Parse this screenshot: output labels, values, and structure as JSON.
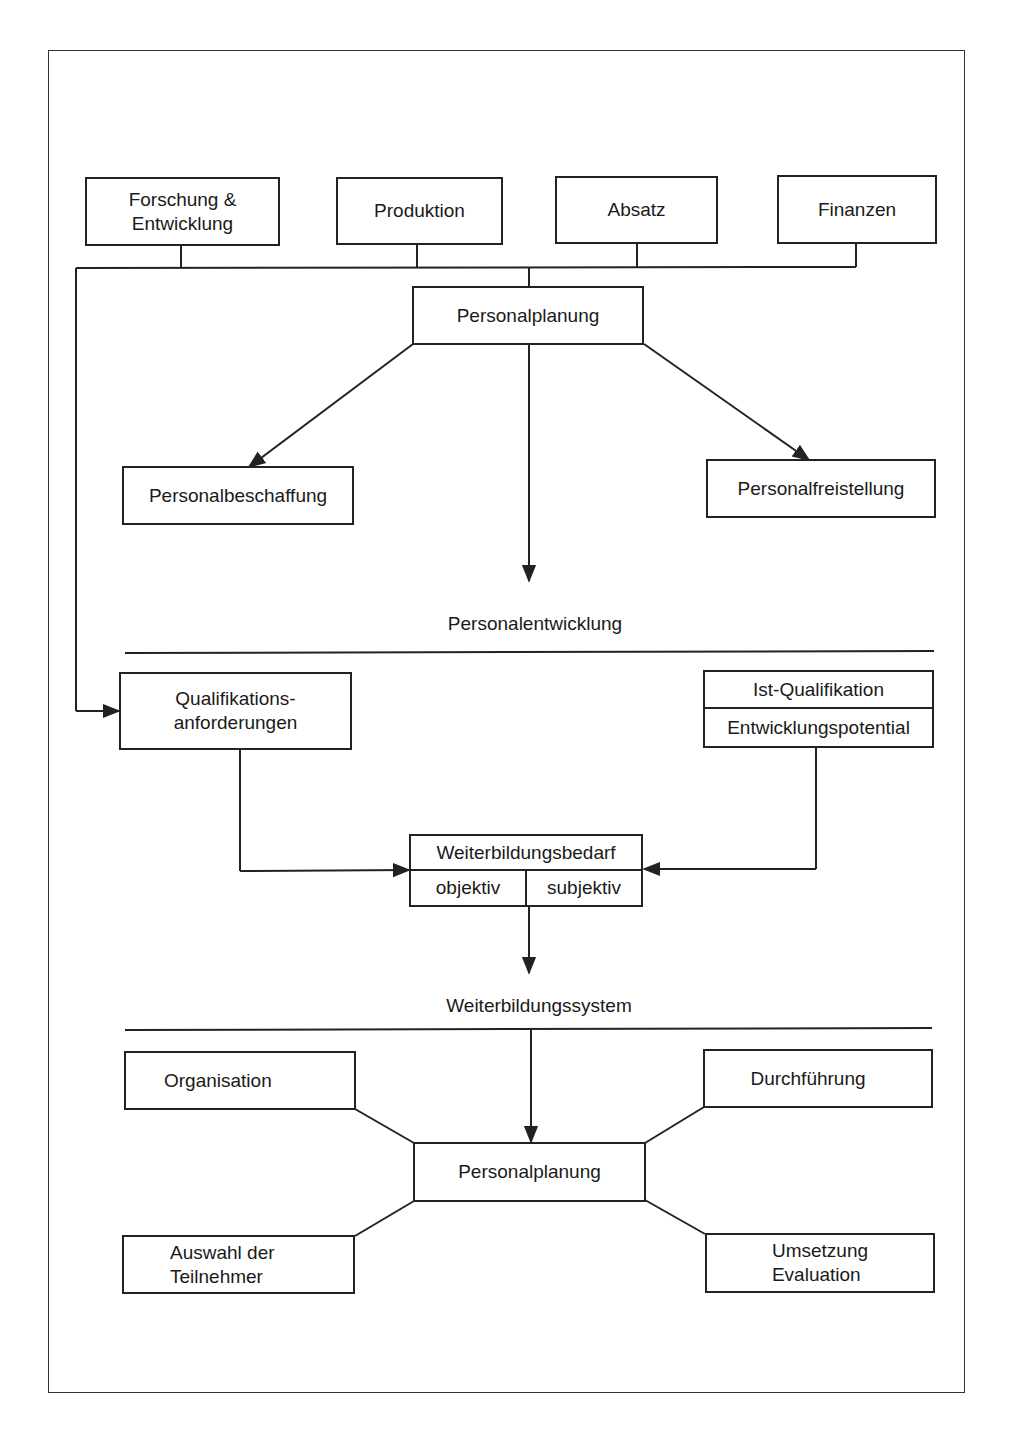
{
  "diagram": {
    "top_departments": [
      {
        "label": "Forschung & Entwicklung",
        "line1": "Forschung &",
        "line2": "Entwicklung"
      },
      {
        "label": "Produktion"
      },
      {
        "label": "Absatz"
      },
      {
        "label": "Finanzen"
      }
    ],
    "planning_top": {
      "label": "Personalplanung"
    },
    "planning_branches": {
      "left": {
        "label": "Personalbeschaffung"
      },
      "right": {
        "label": "Personalfreistellung"
      }
    },
    "section_personalentwicklung": {
      "label": "Personalentwicklung"
    },
    "qualification_requirements": {
      "line1": "Qualifikations-",
      "line2": "anforderungen"
    },
    "current_qualification": {
      "top": "Ist-Qualifikation",
      "bottom": "Entwicklungspotential"
    },
    "training_need": {
      "title": "Weiterbildungsbedarf",
      "left": "objektiv",
      "right": "subjektiv"
    },
    "section_weiterbildungssystem": {
      "label": "Weiterbildungssystem"
    },
    "planning_bottom": {
      "label": "Personalplanung"
    },
    "system_nodes": {
      "top_left": {
        "label": "Organisation"
      },
      "top_right": {
        "label": "Durchführung"
      },
      "bottom_left": {
        "line1": "Auswahl der",
        "line2": "Teilnehmer"
      },
      "bottom_right": {
        "line1": "Umsetzung",
        "line2": "Evaluation"
      }
    },
    "colors": {
      "line": "#222222",
      "background": "#ffffff"
    }
  }
}
